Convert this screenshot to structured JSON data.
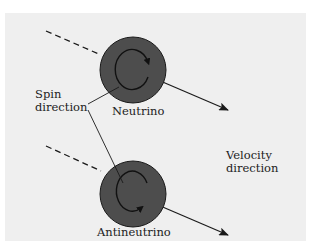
{
  "colors": {
    "background": "#ffffff",
    "panel": "#efefef",
    "particle_fill": "#4d4d4d",
    "particle_stroke": "#1a1a1a",
    "line": "#1a1a1a"
  },
  "labels": {
    "spin_line1": "Spin",
    "spin_line2": "direction",
    "neutrino": "Neutrino",
    "antineutrino": "Antineutrino",
    "velocity_line1": "Velocity",
    "velocity_line2": "direction"
  },
  "particles": [
    {
      "name": "neutrino",
      "spin": "counterclockwise-arrow-top-right"
    },
    {
      "name": "antineutrino",
      "spin": "clockwise-arrow-bottom"
    }
  ]
}
